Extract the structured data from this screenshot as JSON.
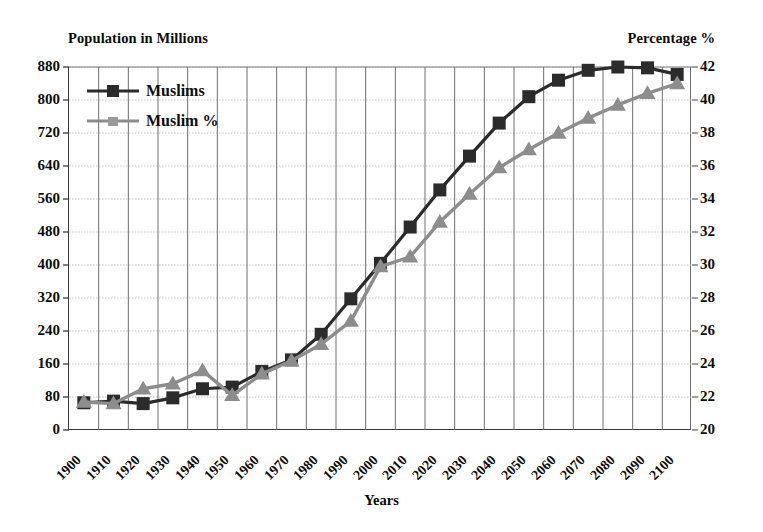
{
  "chart_data": {
    "type": "line",
    "title": "",
    "xlabel": "Years",
    "left_axis_title": "Population in Millions",
    "right_axis_title": "Percentage %",
    "grid": true,
    "legend_position": "top-left",
    "categories": [
      "1900",
      "1910",
      "1920",
      "1930",
      "1940",
      "1950",
      "1960",
      "1970",
      "1980",
      "1990",
      "2000",
      "2010",
      "2020",
      "2030",
      "2040",
      "2050",
      "2060",
      "2070",
      "2080",
      "2090",
      "2100"
    ],
    "left_axis": {
      "label": "Population in Millions",
      "ylim": [
        0,
        880
      ],
      "ticks": [
        0,
        80,
        160,
        240,
        320,
        400,
        480,
        560,
        640,
        720,
        800,
        880
      ]
    },
    "right_axis": {
      "label": "Percentage %",
      "ylim": [
        20,
        42
      ],
      "ticks": [
        20,
        22,
        24,
        26,
        28,
        30,
        32,
        34,
        36,
        38,
        40,
        42
      ]
    },
    "series": [
      {
        "name": "Muslims",
        "axis": "left",
        "marker": "square",
        "color": "#2b2b2b",
        "values": [
          66,
          70,
          64,
          78,
          100,
          104,
          142,
          170,
          232,
          318,
          404,
          492,
          582,
          664,
          744,
          808,
          848,
          872,
          880,
          878,
          862
        ]
      },
      {
        "name": "Muslim %",
        "axis": "right",
        "marker": "triangle",
        "color": "#8d8d8d",
        "values": [
          21.7,
          21.6,
          22.5,
          22.8,
          23.6,
          22.1,
          23.4,
          24.2,
          25.2,
          26.6,
          29.9,
          30.5,
          32.6,
          34.3,
          35.9,
          37.0,
          38.0,
          38.9,
          39.7,
          40.4,
          41.0
        ]
      }
    ]
  },
  "legend": {
    "items": [
      {
        "label": "Muslims",
        "marker": "square",
        "color": "#2b2b2b"
      },
      {
        "label": "Muslim %",
        "marker": "triangle",
        "color": "#8d8d8d"
      }
    ]
  }
}
